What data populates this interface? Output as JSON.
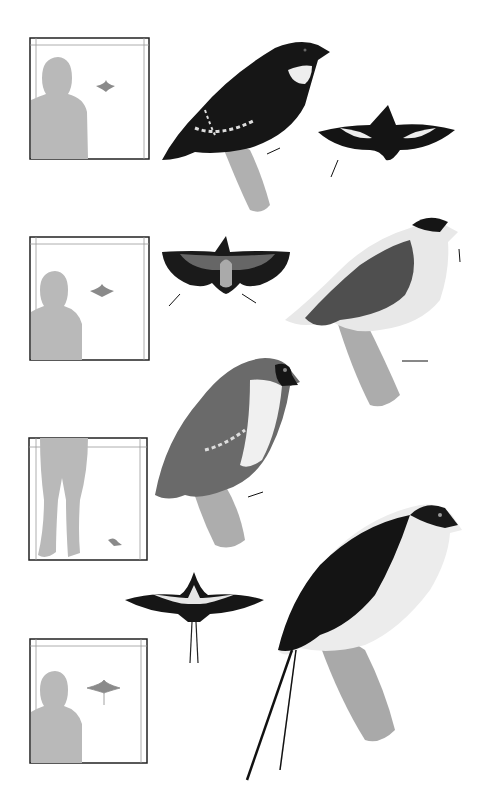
{
  "plate": {
    "description": "Grayscale illustration plate of four perching birds with flight silhouettes and human scale comparison boxes",
    "colors": {
      "background": "#ffffff",
      "silhouette": "#b9b9b9",
      "frame": "#222222",
      "inner_frame": "#9a9a9a",
      "bird_dark": "#151515",
      "bird_mid": "#5c5c5c",
      "bird_light": "#e6e6e6",
      "branch": "#a8a8a8"
    },
    "rows": [
      {
        "scale_box": "human-torso-with-small-flying-bird",
        "bird": "dark bird with white collar",
        "flight_view": "dark underwing with white wing patches"
      },
      {
        "scale_box": "human-torso-with-small-flying-bird",
        "bird": "falcon-like bird with barred grey back",
        "flight_view": "dark wings grey body from above"
      },
      {
        "scale_box": "human-legs-with-small-perched-bird",
        "bird": "grey bird with white throat and dark mask"
      },
      {
        "scale_box": "human-torso-with-small-flying-bird",
        "bird": "dark-backed bird with white underparts and long tail streamers",
        "flight_view": "dark wings with long tail streamers"
      }
    ]
  }
}
